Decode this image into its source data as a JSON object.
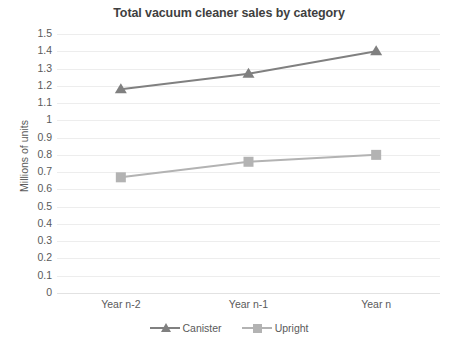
{
  "chart_data": {
    "type": "line",
    "title": "Total vacuum cleaner sales by category",
    "xlabel": "",
    "ylabel": "Millions of units",
    "categories": [
      "Year n-2",
      "Year n-1",
      "Year n"
    ],
    "series": [
      {
        "name": "Canister",
        "values": [
          1.18,
          1.27,
          1.4
        ],
        "color": "#808080",
        "marker": "triangle"
      },
      {
        "name": "Upright",
        "values": [
          0.67,
          0.76,
          0.8
        ],
        "color": "#b3b3b3",
        "marker": "square"
      }
    ],
    "ylim": [
      0,
      1.5
    ],
    "ytick_labels": [
      "1.5",
      "1.4",
      "1.3",
      "1.2",
      "1.1",
      "1",
      "0.9",
      "0.8",
      "0.7",
      "0.6",
      "0.5",
      "0.4",
      "0.3",
      "0.2",
      "0.1",
      "0"
    ],
    "ytick_values": [
      1.5,
      1.4,
      1.3,
      1.2,
      1.1,
      1.0,
      0.9,
      0.8,
      0.7,
      0.6,
      0.5,
      0.4,
      0.3,
      0.2,
      0.1,
      0
    ],
    "grid": true,
    "legend_position": "bottom",
    "gridline_color": "#ededed",
    "background": "#ffffff"
  }
}
